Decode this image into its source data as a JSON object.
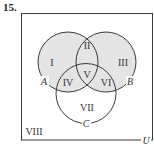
{
  "problem": {
    "number": "15."
  },
  "diagram": {
    "type": "venn-3-set",
    "universe_label": "U",
    "sets": [
      {
        "name": "A"
      },
      {
        "name": "B"
      },
      {
        "name": "C"
      }
    ],
    "shading_color": "#e4e4e4",
    "stroke_color": "#3a3a3a",
    "shaded_regions": [
      "I",
      "II",
      "III",
      "IV",
      "V",
      "VI"
    ],
    "regions": {
      "r1": "I",
      "r2": "II",
      "r3": "III",
      "r4": "IV",
      "r5": "V",
      "r6": "VI",
      "r7": "VII",
      "r8": "VIII"
    },
    "set_labels": {
      "a": "A",
      "b": "B",
      "c": "C",
      "u": "U"
    }
  }
}
